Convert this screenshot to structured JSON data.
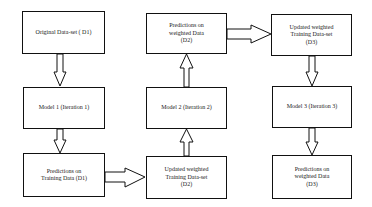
{
  "diagram": {
    "type": "flowchart",
    "nodes": [
      {
        "id": "original",
        "label": "Original Data-set ( D1)"
      },
      {
        "id": "model1",
        "label": "Model 1 (Iteration 1)"
      },
      {
        "id": "pred_train",
        "label": "Predictions on\nTraining Data (D1)"
      },
      {
        "id": "updated_d2",
        "label": "Updated weighted\nTraining Data-set\n(D2)"
      },
      {
        "id": "model2",
        "label": "Model 2 (Iteration 2)"
      },
      {
        "id": "pred_weighted_d2",
        "label": "Predictions on\nweighted  Data\n(D2)"
      },
      {
        "id": "updated_d3",
        "label": "Updated weighted\nTraining Data-set\n(D3)"
      },
      {
        "id": "model3",
        "label": "Model 3 (Iteration 3)"
      },
      {
        "id": "pred_weighted_d3",
        "label": "Predictions on\nweighted  Data\n(D3)"
      }
    ],
    "edges": [
      {
        "from": "original",
        "to": "model1",
        "direction": "down"
      },
      {
        "from": "model1",
        "to": "pred_train",
        "direction": "down"
      },
      {
        "from": "pred_train",
        "to": "updated_d2",
        "direction": "right"
      },
      {
        "from": "updated_d2",
        "to": "model2",
        "direction": "up"
      },
      {
        "from": "model2",
        "to": "pred_weighted_d2",
        "direction": "up"
      },
      {
        "from": "pred_weighted_d2",
        "to": "updated_d3",
        "direction": "right"
      },
      {
        "from": "updated_d3",
        "to": "model3",
        "direction": "down"
      },
      {
        "from": "model3",
        "to": "pred_weighted_d3",
        "direction": "down"
      }
    ],
    "colors": {
      "stroke": "#111111",
      "background": "#ffffff",
      "text": "#222222"
    }
  }
}
